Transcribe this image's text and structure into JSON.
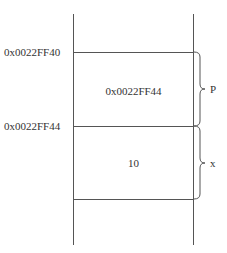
{
  "diagram": {
    "title": "",
    "addresses": [
      {
        "text": "0x0022FF40"
      },
      {
        "text": "0x0022FF44"
      }
    ],
    "cells": [
      {
        "value": "0x0022FF44",
        "variable": "P"
      },
      {
        "value": "10",
        "variable": "x"
      }
    ],
    "colors": {
      "line": "#555555",
      "text": "#333333",
      "background": "#ffffff"
    }
  }
}
